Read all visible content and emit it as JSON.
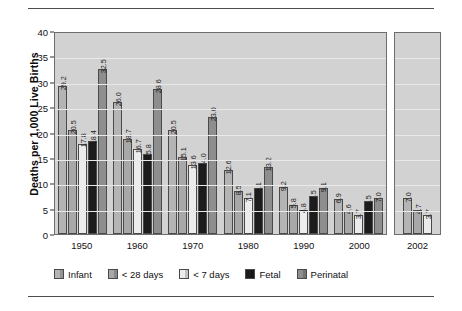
{
  "chart_data": {
    "type": "bar",
    "title": "",
    "subtitle": "",
    "xlabel": "",
    "ylabel": "Deaths per 1,000 Live Births",
    "ylim": [
      0,
      40
    ],
    "yticks": [
      0,
      5,
      10,
      15,
      20,
      25,
      30,
      35,
      40
    ],
    "ytick_labels": [
      "0",
      "5",
      "10",
      "15",
      "20",
      "25",
      "30",
      "35",
      "40"
    ],
    "grid": true,
    "legend_position": "bottom",
    "categories": [
      "1950",
      "1960",
      "1970",
      "1980",
      "1990",
      "2000",
      "2002"
    ],
    "series": [
      {
        "name": "Infant",
        "color": "#b4b4b4",
        "values": [
          29.2,
          26.0,
          20.5,
          12.6,
          9.2,
          6.9,
          7.0
        ]
      },
      {
        "name": "< 28 days",
        "color": "#a8a8a8",
        "values": [
          20.5,
          18.7,
          15.1,
          8.5,
          5.8,
          4.6,
          4.7
        ]
      },
      {
        "name": "< 7 days",
        "color": "#ececec",
        "values": [
          17.8,
          16.7,
          13.6,
          7.1,
          4.8,
          3.7,
          3.7
        ]
      },
      {
        "name": "Fetal",
        "color": "#1c1c1c",
        "values": [
          18.4,
          15.8,
          14.0,
          9.1,
          7.5,
          6.5,
          null
        ]
      },
      {
        "name": "Perinatal",
        "color": "#8e8e8e",
        "values": [
          32.5,
          28.6,
          23.0,
          13.2,
          9.1,
          7.0,
          null
        ]
      }
    ],
    "bar_labels": {
      "1950": [
        "29.2",
        "20.5",
        "17.8",
        "18.4",
        "32.5"
      ],
      "1960": [
        "26.0",
        "18.7",
        "16.7",
        "15.8",
        "28.6"
      ],
      "1970": [
        "20.5",
        "15.1",
        "13.6",
        "14.0",
        "23.0"
      ],
      "1980": [
        "12.6",
        "8.5",
        "7.1",
        "9.1",
        "13.2"
      ],
      "1990": [
        "9.2",
        "5.8",
        "4.8",
        "7.5",
        "9.1"
      ],
      "2000": [
        "6.9",
        "4.6",
        "3.7",
        "6.5",
        "7.0"
      ],
      "2002": [
        "7.0",
        "4.7",
        "3.7"
      ]
    }
  },
  "axis": {
    "y_title": "Deaths per 1,000 Live Births",
    "y_ticks": [
      "40",
      "35",
      "30",
      "25",
      "20",
      "15",
      "10",
      "5",
      "0"
    ],
    "x_ticks_main": [
      "1950",
      "1960",
      "1970",
      "1980",
      "1990",
      "2000"
    ],
    "x_tick_break": "2002"
  },
  "legend": {
    "items": [
      {
        "label": "Infant",
        "color": "#b4b4b4"
      },
      {
        "label": "< 28 days",
        "color": "#a8a8a8"
      },
      {
        "label": "< 7 days",
        "color": "#ececec"
      },
      {
        "label": "Fetal",
        "color": "#1c1c1c"
      },
      {
        "label": "Perinatal",
        "color": "#8e8e8e"
      }
    ]
  }
}
